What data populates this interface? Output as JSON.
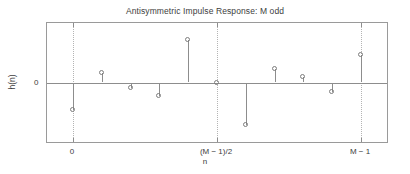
{
  "chart_data": {
    "type": "stem",
    "title": "Antisymmetric Impulse Response: M odd",
    "xlabel": "n",
    "ylabel": "h(n)",
    "x": [
      0,
      1,
      2,
      3,
      4,
      5,
      6,
      7,
      8,
      9,
      10
    ],
    "values": [
      -0.46,
      0.16,
      -0.09,
      -0.23,
      0.72,
      0.0,
      -0.72,
      0.23,
      0.09,
      -0.16,
      0.46
    ],
    "ylim": [
      -1.0,
      1.0
    ],
    "xlim": [
      -0.9,
      10.9
    ],
    "grid": false,
    "gridlines_x": [
      0,
      5,
      10
    ],
    "yticks": [
      0
    ],
    "ytick_labels": [
      "0"
    ],
    "xticks": [
      0,
      5,
      10
    ],
    "xtick_labels": [
      "0",
      "(M − 1)/2",
      "M − 1"
    ],
    "legend": null,
    "marker": "open-circle",
    "line_color": "#8d8d8d",
    "marker_color": "#7d7d7d",
    "axes_color": "#9a9a9a",
    "grid_color": "#b4b4b4",
    "background": "#ffffff"
  }
}
